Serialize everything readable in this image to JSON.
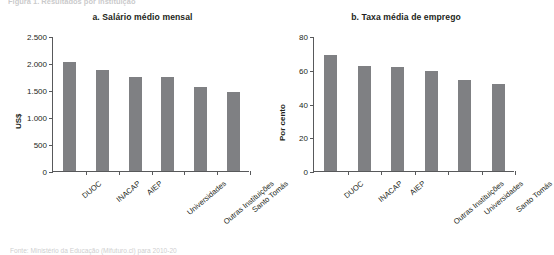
{
  "figure": {
    "header_text": "Figura 1. Resultados por instituição",
    "source": "Fonte: Ministério da Educação (Mifuturo.cl) para 2010-20"
  },
  "chart_data": [
    {
      "type": "bar",
      "panel_label": "a",
      "title": "a. Salário médio mensal",
      "xlabel": "",
      "ylabel": "US$",
      "ylim": [
        0,
        2500
      ],
      "yticks": [
        0,
        500,
        1000,
        1500,
        2000,
        2500
      ],
      "ytick_labels": [
        "0",
        "500",
        "1.000",
        "1.500",
        "2.000",
        "2.500"
      ],
      "grid": false,
      "legend": "none",
      "bar_color": "#7f8083",
      "categories": [
        "DUOC",
        "INACAP",
        "AIEP",
        "Universidades",
        "Outras Instituições",
        "Santo Tomás"
      ],
      "values": [
        2010,
        1870,
        1740,
        1735,
        1555,
        1465
      ]
    },
    {
      "type": "bar",
      "panel_label": "b",
      "title": "b. Taxa média de emprego",
      "xlabel": "",
      "ylabel": "Por cento",
      "ylim": [
        0,
        80
      ],
      "yticks": [
        0,
        20,
        40,
        60,
        80
      ],
      "ytick_labels": [
        "0",
        "20",
        "40",
        "60",
        "80"
      ],
      "grid": false,
      "legend": "none",
      "bar_color": "#7f8083",
      "categories": [
        "DUOC",
        "INACAP",
        "AIEP",
        "Outras Instituições",
        "Universidades",
        "Santo Tomás"
      ],
      "values": [
        69,
        62,
        61.5,
        59,
        54,
        51.5
      ]
    }
  ]
}
